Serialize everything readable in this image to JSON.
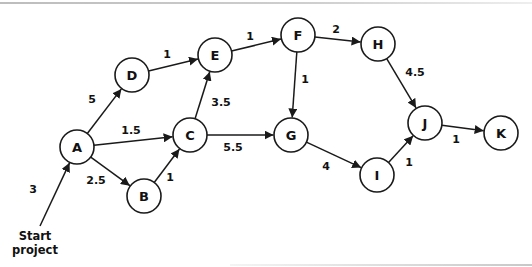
{
  "diagram": {
    "type": "activity-network",
    "node_radius": 17,
    "stroke_color": "#1a1a1a",
    "start": {
      "label_line1": "Start",
      "label_line2": "project",
      "from": [
        40,
        226
      ],
      "to": "A",
      "duration": "3",
      "label_pos": [
        33,
        193
      ]
    },
    "nodes": [
      {
        "id": "A",
        "label": "A",
        "x": 77,
        "y": 147
      },
      {
        "id": "B",
        "label": "B",
        "x": 144,
        "y": 196
      },
      {
        "id": "C",
        "label": "C",
        "x": 190,
        "y": 135
      },
      {
        "id": "D",
        "label": "D",
        "x": 132,
        "y": 75
      },
      {
        "id": "E",
        "label": "E",
        "x": 215,
        "y": 55
      },
      {
        "id": "F",
        "label": "F",
        "x": 298,
        "y": 35
      },
      {
        "id": "G",
        "label": "G",
        "x": 291,
        "y": 135
      },
      {
        "id": "H",
        "label": "H",
        "x": 378,
        "y": 44
      },
      {
        "id": "I",
        "label": "I",
        "x": 377,
        "y": 175
      },
      {
        "id": "J",
        "label": "J",
        "x": 425,
        "y": 123
      },
      {
        "id": "K",
        "label": "K",
        "x": 501,
        "y": 133
      }
    ],
    "edges": [
      {
        "from": "A",
        "to": "D",
        "duration": "5",
        "label_pos": [
          92,
          103
        ]
      },
      {
        "from": "A",
        "to": "C",
        "duration": "1.5",
        "label_pos": [
          131,
          134
        ]
      },
      {
        "from": "A",
        "to": "B",
        "duration": "2.5",
        "label_pos": [
          96,
          184
        ]
      },
      {
        "from": "B",
        "to": "C",
        "duration": "1",
        "label_pos": [
          170,
          181
        ]
      },
      {
        "from": "D",
        "to": "E",
        "duration": "1",
        "label_pos": [
          167,
          58
        ]
      },
      {
        "from": "C",
        "to": "E",
        "duration": "3.5",
        "label_pos": [
          221,
          106
        ]
      },
      {
        "from": "C",
        "to": "G",
        "duration": "5.5",
        "label_pos": [
          233,
          151
        ]
      },
      {
        "from": "E",
        "to": "F",
        "duration": "1",
        "label_pos": [
          250,
          40
        ]
      },
      {
        "from": "F",
        "to": "H",
        "duration": "2",
        "label_pos": [
          336,
          33
        ]
      },
      {
        "from": "F",
        "to": "G",
        "duration": "1",
        "label_pos": [
          305,
          83
        ]
      },
      {
        "from": "H",
        "to": "J",
        "duration": "4.5",
        "label_pos": [
          415,
          76
        ]
      },
      {
        "from": "G",
        "to": "I",
        "duration": "4",
        "label_pos": [
          326,
          170
        ]
      },
      {
        "from": "I",
        "to": "J",
        "duration": "1",
        "label_pos": [
          409,
          166
        ]
      },
      {
        "from": "J",
        "to": "K",
        "duration": "1",
        "label_pos": [
          456,
          143
        ]
      }
    ]
  }
}
